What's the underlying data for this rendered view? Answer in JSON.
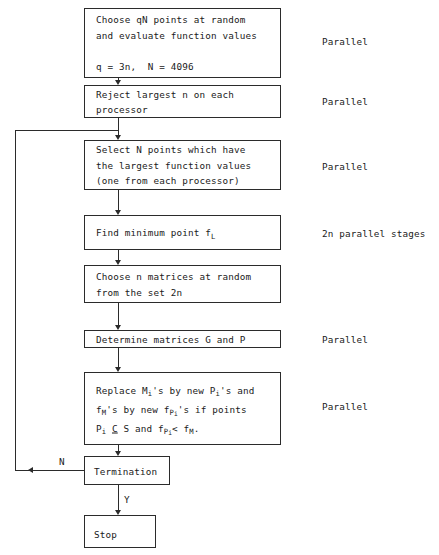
{
  "diagram": {
    "nodes": [
      {
        "id": "choose-points",
        "lines": [
          "Choose qN points at random",
          "and evaluate function values",
          "",
          "q = 3n,  N = 4096"
        ],
        "side_label": "Parallel"
      },
      {
        "id": "reject-largest",
        "lines": [
          "Reject largest n on each",
          "processor"
        ],
        "side_label": "Parallel"
      },
      {
        "id": "select-points",
        "lines": [
          "Select N points which have",
          "the largest function values",
          "(one from each processor)"
        ],
        "side_label": "Parallel"
      },
      {
        "id": "find-minimum",
        "lines": [
          "Find minimum point f_L"
        ],
        "side_label": "2n parallel stages"
      },
      {
        "id": "choose-matrices",
        "lines": [
          "Choose n matrices at random",
          "from the set 2n"
        ],
        "side_label": ""
      },
      {
        "id": "determine-matrices",
        "lines": [
          "Determine matrices G and P"
        ],
        "side_label": "Parallel"
      },
      {
        "id": "replace",
        "lines": [
          "Replace M_i's by new P_i's and",
          "f_M's by new f_P_i's if points",
          "P_i ⊆ S and f_P_i < f_M."
        ],
        "side_label": "Parallel"
      },
      {
        "id": "termination",
        "lines": [
          "Termination"
        ],
        "side_label": ""
      },
      {
        "id": "stop",
        "lines": [
          "Stop"
        ],
        "side_label": ""
      }
    ],
    "edge_labels": {
      "no_branch": "N",
      "yes_branch": "Y"
    },
    "colors": {
      "stroke": "#2b2b2b",
      "text": "#1a1a1a",
      "background": "#ffffff"
    }
  }
}
